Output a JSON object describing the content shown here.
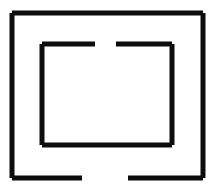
{
  "figure": {
    "canvas": {
      "width": 218,
      "height": 190,
      "background_color": "#ffffff"
    },
    "stroke_color": "#0d0d0d",
    "shapes": [
      {
        "name": "outer-rectangle",
        "label": "Outer rectangle with bottom gap",
        "stroke_width": 5,
        "bounds": {
          "x1": 12,
          "y1": 13,
          "x2": 203,
          "y2": 178
        },
        "gap": {
          "edge": "bottom",
          "start": 82,
          "end": 128
        },
        "segments": [
          {
            "name": "outer-top-edge",
            "x1": 12,
            "y1": 13,
            "x2": 203,
            "y2": 13
          },
          {
            "name": "outer-right-edge",
            "x1": 203,
            "y1": 13,
            "x2": 203,
            "y2": 178
          },
          {
            "name": "outer-left-edge",
            "x1": 12,
            "y1": 13,
            "x2": 12,
            "y2": 178
          },
          {
            "name": "outer-bottom-left-segment",
            "x1": 12,
            "y1": 178,
            "x2": 82,
            "y2": 178
          },
          {
            "name": "outer-bottom-right-segment",
            "x1": 128,
            "y1": 178,
            "x2": 203,
            "y2": 178
          }
        ]
      },
      {
        "name": "inner-rectangle",
        "label": "Inner rectangle with top gap",
        "stroke_width": 5,
        "bounds": {
          "x1": 42,
          "y1": 44,
          "x2": 172,
          "y2": 145
        },
        "gap": {
          "edge": "top",
          "start": 95,
          "end": 116
        },
        "segments": [
          {
            "name": "inner-top-left-segment",
            "x1": 42,
            "y1": 44,
            "x2": 95,
            "y2": 44
          },
          {
            "name": "inner-top-right-segment",
            "x1": 116,
            "y1": 44,
            "x2": 172,
            "y2": 44
          },
          {
            "name": "inner-left-edge",
            "x1": 42,
            "y1": 44,
            "x2": 42,
            "y2": 145
          },
          {
            "name": "inner-right-edge",
            "x1": 172,
            "y1": 44,
            "x2": 172,
            "y2": 145
          },
          {
            "name": "inner-bottom-edge",
            "x1": 42,
            "y1": 145,
            "x2": 172,
            "y2": 145
          }
        ]
      }
    ]
  }
}
